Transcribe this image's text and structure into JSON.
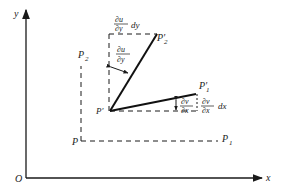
{
  "diagram": {
    "axes": {
      "x_label": "x",
      "y_label": "y",
      "origin_label": "O"
    },
    "points": {
      "P": "P",
      "P1": "P",
      "P1_sub": "1",
      "P2": "P",
      "P2_sub": "2",
      "P_prime": "P′",
      "P1_prime": "P′",
      "P1_prime_sub": "1",
      "P2_prime": "P′",
      "P2_prime_sub": "2"
    },
    "annotations": {
      "du_dy_dy": {
        "num": "∂u",
        "den": "∂y",
        "suffix": "dy"
      },
      "du_dy_angle": {
        "num": "∂u",
        "den": "∂y"
      },
      "dv_dx_angle": {
        "num": "∂v",
        "den": "∂x"
      },
      "dv_dx_dx": {
        "num": "∂v",
        "den": "∂x",
        "suffix": "dx"
      }
    },
    "colors": {
      "ink": "#1a1a1a",
      "background": "#ffffff"
    }
  }
}
